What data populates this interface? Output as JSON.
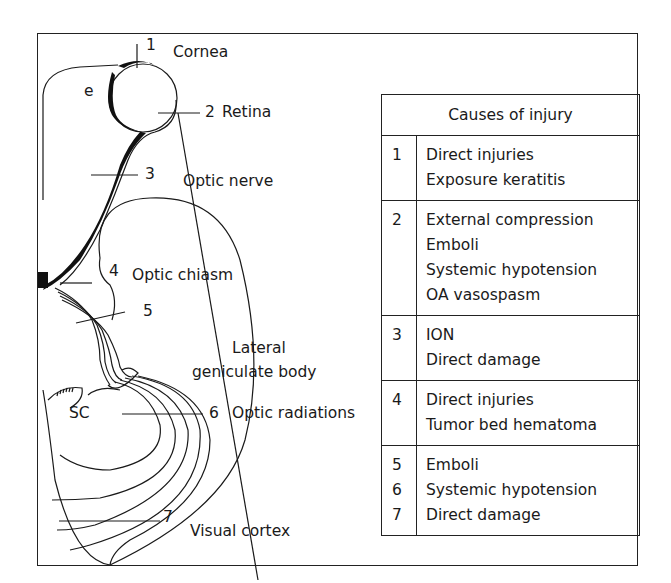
{
  "diagram": {
    "labels": {
      "cornea": "Cornea",
      "retina": "Retina",
      "optic_nerve": "Optic nerve",
      "optic_chiasm": "Optic chiasm",
      "lgb_line1": "Lateral",
      "lgb_line2": "geniculate body",
      "optic_radiations": "Optic radiations",
      "visual_cortex": "Visual cortex",
      "sc": "SC",
      "e": "e"
    },
    "markers": [
      "1",
      "2",
      "3",
      "4",
      "5",
      "6",
      "7"
    ]
  },
  "table": {
    "title": "Causes of injury",
    "rows": [
      {
        "nums": [
          "1"
        ],
        "items": [
          "Direct injuries",
          "Exposure keratitis"
        ]
      },
      {
        "nums": [
          "2"
        ],
        "items": [
          "External compression",
          "Emboli",
          "Systemic hypotension",
          "OA vasospasm"
        ]
      },
      {
        "nums": [
          "3"
        ],
        "items": [
          "ION",
          "Direct damage"
        ]
      },
      {
        "nums": [
          "4"
        ],
        "items": [
          "Direct injuries",
          "Tumor bed hematoma"
        ]
      },
      {
        "nums": [
          "5",
          "6",
          "7"
        ],
        "items": [
          "Emboli",
          "Systemic hypotension",
          "Direct damage"
        ]
      }
    ]
  }
}
